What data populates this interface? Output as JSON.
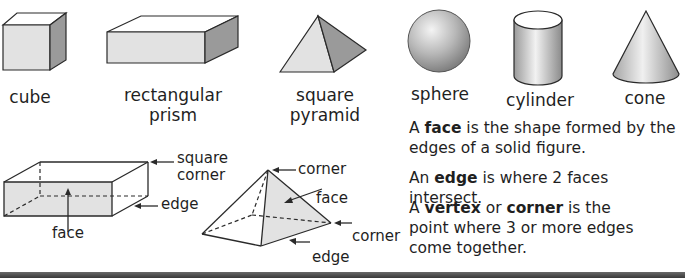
{
  "solids": [
    {
      "id": "cube",
      "label": "cube"
    },
    {
      "id": "rectangular-prism",
      "label_line1": "rectangular",
      "label_line2": "prism"
    },
    {
      "id": "square-pyramid",
      "label_line1": "square",
      "label_line2": "pyramid"
    },
    {
      "id": "sphere",
      "label": "sphere"
    },
    {
      "id": "cylinder",
      "label": "cylinder"
    },
    {
      "id": "cone",
      "label": "cone"
    }
  ],
  "prism_diagram": {
    "annotations": {
      "square_corner_line1": "square",
      "square_corner_line2": "corner",
      "edge": "edge",
      "face": "face"
    }
  },
  "pyramid_diagram": {
    "annotations": {
      "corner_top": "corner",
      "face": "face",
      "corner_right": "corner",
      "edge": "edge"
    }
  },
  "definitions": {
    "face": {
      "pre": "A ",
      "term": "face",
      "post_line1": " is the shape formed by the",
      "line2": "edges of a solid figure."
    },
    "edge": {
      "pre": "An ",
      "term": "edge",
      "post": " is where 2 faces intersect."
    },
    "vertex": {
      "pre": "A ",
      "term1": "vertex",
      "mid": " or ",
      "term2": "corner",
      "post_line1": " is the",
      "line2": "point where 3 or more edges",
      "line3": "come together."
    }
  },
  "colors": {
    "face_light": "#e2e2e2",
    "face_dark": "#9a9a9a",
    "outline": "#2a2a2a",
    "bottom_bar": "#4a4a4a"
  }
}
